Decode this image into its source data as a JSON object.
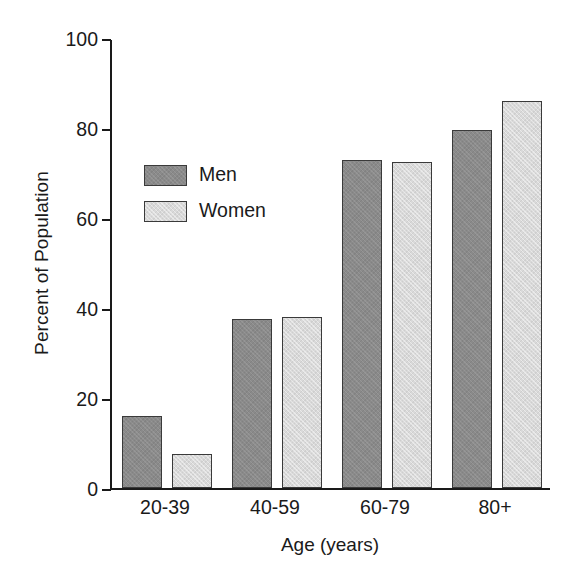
{
  "chart_data": {
    "type": "bar",
    "title": "",
    "xlabel": "Age (years)",
    "ylabel": "Percent of Population",
    "categories": [
      "20-39",
      "40-59",
      "60-79",
      "80+"
    ],
    "series": [
      {
        "name": "Men",
        "color": "#8a8a8a",
        "values": [
          16.0,
          37.5,
          73.0,
          79.5
        ]
      },
      {
        "name": "Women",
        "color": "#d9d9d9",
        "values": [
          7.5,
          38.0,
          72.5,
          86.0
        ]
      }
    ],
    "ylim": [
      0,
      100
    ],
    "yticks": [
      0,
      20,
      40,
      60,
      80,
      100
    ],
    "ytick_labels": [
      "0",
      "20",
      "40",
      "60",
      "80",
      "100"
    ],
    "grid": false,
    "legend_position": "inside-upper-left",
    "axis_color": "#1a1a1a",
    "bar_edge_color": "#3a3a3a",
    "background": "#ffffff"
  }
}
